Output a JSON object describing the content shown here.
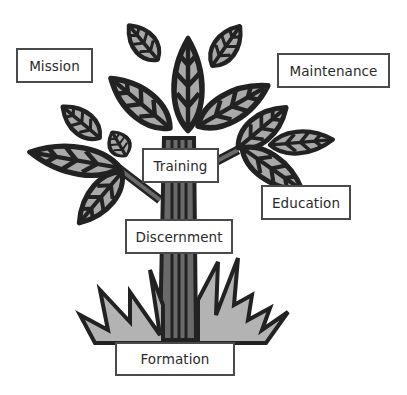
{
  "diagram": {
    "type": "tree-metaphor",
    "colors": {
      "leaf_fill": "#a9a9a9",
      "outline": "#222222",
      "trunk": "#5a5a5a",
      "grass": "#b3b3b3",
      "box_border": "#4a4a4a"
    },
    "labels": {
      "mission": "Mission",
      "maintenance": "Maintenance",
      "training": "Training",
      "education": "Education",
      "discernment": "Discernment",
      "formation": "Formation"
    }
  }
}
